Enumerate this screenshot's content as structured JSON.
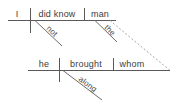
{
  "diagram": {
    "type": "reed-kellogg-sentence-diagram",
    "sentence": "I did not know the man whom he brought along.",
    "clauses": [
      {
        "name": "main-clause",
        "baseline": {
          "x1": 8,
          "y": 20,
          "x2": 116
        },
        "slots": [
          {
            "name": "subject",
            "label": "I",
            "x": 17,
            "y": 17
          },
          {
            "name": "verb",
            "label": "did know",
            "x": 38,
            "y": 17
          },
          {
            "name": "direct-object",
            "label": "man",
            "x": 92,
            "y": 17
          }
        ],
        "dividers": [
          {
            "name": "subject-verb-divider",
            "x": 30,
            "y1": 8,
            "y2": 33,
            "kind": "full"
          },
          {
            "name": "verb-object-divider",
            "x": 84,
            "y1": 8,
            "y2": 20,
            "kind": "half"
          }
        ],
        "modifiers": [
          {
            "name": "adverb-not",
            "label": "not",
            "x1": 35,
            "y1": 20,
            "x2": 62,
            "y2": 46
          },
          {
            "name": "article-the",
            "label": "the",
            "x1": 95,
            "y1": 20,
            "x2": 117,
            "y2": 42
          }
        ]
      },
      {
        "name": "relative-clause",
        "baseline": {
          "x1": 28,
          "y": 70,
          "x2": 170
        },
        "slots": [
          {
            "name": "subject",
            "label": "he",
            "x": 42,
            "y": 66
          },
          {
            "name": "verb",
            "label": "brought",
            "x": 68,
            "y": 66
          },
          {
            "name": "object",
            "label": "whom",
            "x": 123,
            "y": 66
          }
        ],
        "dividers": [
          {
            "name": "subject-verb-divider",
            "x": 59,
            "y1": 58,
            "y2": 82,
            "kind": "full"
          },
          {
            "name": "verb-object-divider",
            "x": 113,
            "y1": 58,
            "y2": 70,
            "kind": "half"
          }
        ],
        "modifiers": [
          {
            "name": "adverb-along",
            "label": "along",
            "x1": 63,
            "y1": 70,
            "x2": 102,
            "y2": 100
          }
        ]
      }
    ],
    "connector": {
      "name": "relative-pronoun-connector",
      "style": "dotted",
      "x1": 110,
      "y1": 20,
      "x2": 170,
      "y2": 70
    },
    "colors": {
      "line": "#595959",
      "slant": "#6b6b6b",
      "dotted": "#a8a8a8",
      "text": "#3c3c3c",
      "background": "#ffffff"
    }
  }
}
